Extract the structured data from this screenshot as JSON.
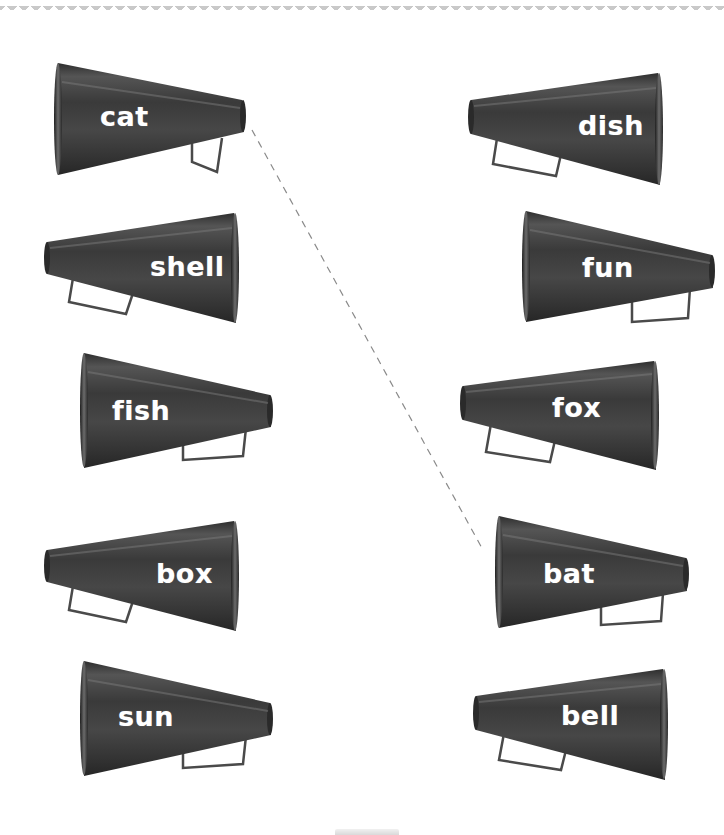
{
  "worksheet": {
    "left_column": [
      {
        "word": "cat",
        "wide_end": "left"
      },
      {
        "word": "shell",
        "wide_end": "right"
      },
      {
        "word": "fish",
        "wide_end": "left"
      },
      {
        "word": "box",
        "wide_end": "right"
      },
      {
        "word": "sun",
        "wide_end": "left"
      }
    ],
    "right_column": [
      {
        "word": "dish",
        "wide_end": "right"
      },
      {
        "word": "fun",
        "wide_end": "left"
      },
      {
        "word": "fox",
        "wide_end": "right"
      },
      {
        "word": "bat",
        "wide_end": "left"
      },
      {
        "word": "bell",
        "wide_end": "right"
      }
    ],
    "example_match": {
      "from": "cat",
      "to": "bat",
      "style": "dashed"
    },
    "colors": {
      "megaphone_body": "#3d3d3d",
      "megaphone_highlight": "#6a6a6a",
      "label_text": "#ffffff",
      "dashed_line": "#8a8a8a",
      "border_pattern": "#c9c9c9",
      "background": "#ffffff"
    }
  }
}
